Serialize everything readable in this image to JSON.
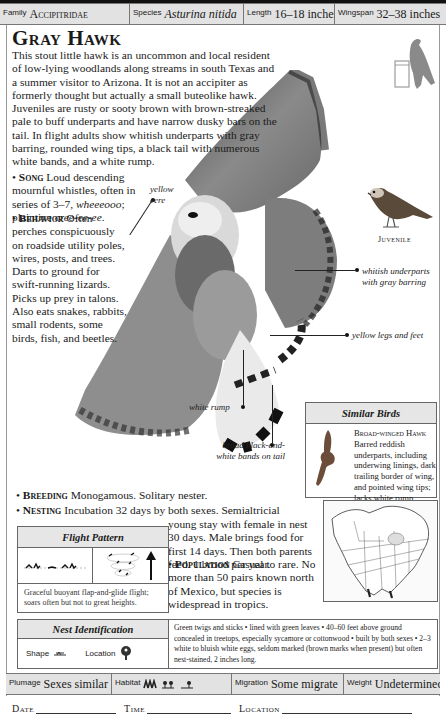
{
  "header": {
    "family_label": "Family",
    "family": "Accipitridae",
    "species_label": "Species",
    "species": "Asturina nitida",
    "length_label": "Length",
    "length": "16–18 inches",
    "wingspan_label": "Wingspan",
    "wingspan": "32–38 inches"
  },
  "title": "Gray Hawk",
  "intro": "This stout little hawk is an uncommon and local resident of low-lying woodlands along streams in south Texas and a summer visitor to Arizona. It is not an accipiter as formerly thought but actually a small buteolike hawk. Juveniles are rusty or sooty brown with brown-streaked pale to buff underparts and have narrow dusky bars on the tail. In flight adults show whitish underparts with gray barring, rounded wing tips, a black tail with numerous white bands, and a white rump.",
  "song": {
    "bullet": "•",
    "heading": "Song",
    "text_before": " Loud descending mournful whistles, often in series of 3–7, ",
    "call1": "wheeeooo",
    "text_mid": "; plaintive ",
    "call2": "cree-ee-ee",
    "text_end": "."
  },
  "behavior": {
    "bullet": "•",
    "heading": "Behavior",
    "text": " Often perches conspicuously on roadside utility poles, wires, posts, and trees. Darts to ground for swift-running lizards. Picks up prey in talons. Also eats snakes, rabbits, small rodents, some birds, fish, and beetles."
  },
  "annotations": {
    "cere": "yellow cere",
    "underparts": "whitish underparts with gray barring",
    "legs": "yellow legs and feet",
    "rump": "white rump",
    "tail": "broad black-and-white bands on tail"
  },
  "juvenile_label": "Juvenile",
  "similar_birds": {
    "heading": "Similar Birds",
    "items": [
      {
        "name": "Broad-winged Hawk",
        "text": "Barred reddish underparts, including underwing linings, dark trailing border of wing, and pointed wing tips; lacks white rump patch."
      }
    ]
  },
  "breeding": {
    "bullet": "•",
    "heading": "Breeding",
    "text": " Monogamous. Solitary nester."
  },
  "nesting": {
    "bullet": "•",
    "heading": "Nesting",
    "text1": " Incubation 32 days by both sexes. Semialtricial",
    "text2": "young stay with female in nest 30 days. Male brings food for first 14 days. Then both parents feed. 1 brood per year."
  },
  "population": {
    "bullet": "•",
    "heading": "Population",
    "text": " Casual to rare. No more than 50 pairs known north of Mexico, but species is widespread in tropics."
  },
  "flight_pattern": {
    "heading": "Flight Pattern",
    "description": "Graceful buoyant flap-and-glide flight; soars often but not to great heights."
  },
  "nest_identification": {
    "heading": "Nest Identification",
    "shape_label": "Shape",
    "location_label": "Location",
    "description": "Green twigs and sticks • lined with green leaves • 40–60 feet above ground concealed in treetops, especially sycamore or cottonwood • built by both sexes • 2–3 white to bluish white eggs, seldom marked (brown marks when present) but often nest-stained, 2 inches long."
  },
  "footer": {
    "plumage_label": "Plumage",
    "plumage": "Sexes similar",
    "habitat_label": "Habitat",
    "migration_label": "Migration",
    "migration": "Some migrate",
    "weight_label": "Weight",
    "weight": "Undetermined"
  },
  "log": {
    "date": "Date",
    "time": "Time",
    "location": "Location"
  }
}
